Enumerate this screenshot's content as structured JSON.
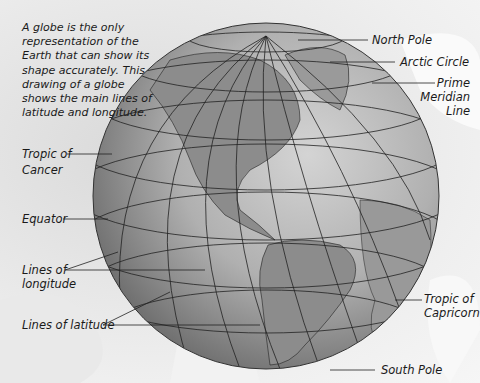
{
  "intro_text": "A globe is the only representation of the Earth that can show its shape accurately. This drawing of a globe shows the main lines of latitude and longitude.",
  "labels": {
    "north_pole": "North Pole",
    "arctic_circle": "Arctic Circle",
    "prime_meridian_1": "Prime",
    "prime_meridian_2": "Meridian",
    "prime_meridian_3": "Line",
    "tropic_cancer_1": "Tropic of",
    "tropic_cancer_2": "Cancer",
    "equator": "Equator",
    "longitude_1": "Lines of",
    "longitude_2": "longitude",
    "latitude": "Lines of latitude",
    "tropic_capricorn_1": "Tropic of",
    "tropic_capricorn_2": "Capricorn",
    "south_pole": "South Pole"
  },
  "colors": {
    "globe_light": "#c8c8c8",
    "globe_dark": "#6a6a6a",
    "land": "#8a8a8a",
    "grid": "#222222",
    "text": "#1a1a1a"
  }
}
